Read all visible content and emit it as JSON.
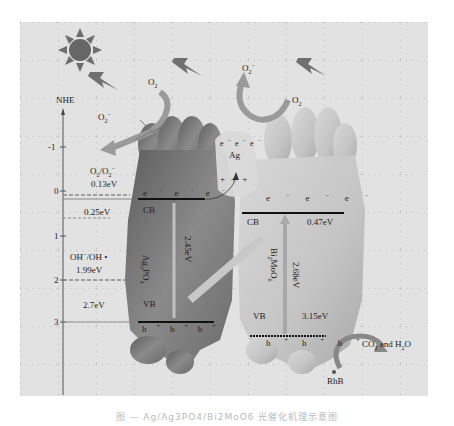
{
  "diagram": {
    "axis": {
      "label": "NHE",
      "ticks": [
        "-1",
        "0",
        "1",
        "2",
        "3"
      ]
    },
    "reference_levels": [
      {
        "label": "O2/O2-",
        "value": "0.13eV"
      },
      {
        "label": "OH-/OH•",
        "value": "1.99eV"
      }
    ],
    "ag3po4": {
      "name": "Ag3PO4",
      "cb_label": "CB",
      "vb_label": "VB",
      "cb_value": "0.25eV",
      "vb_value": "2.7eV",
      "band_gap": "2.45eV",
      "electrons": [
        "e-",
        "e-",
        "e-"
      ],
      "holes": [
        "h+",
        "h+",
        "h+"
      ]
    },
    "ag": {
      "name": "Ag",
      "electrons": [
        "e-",
        "e-",
        "e-"
      ],
      "holes": [
        "+",
        "+",
        "+"
      ]
    },
    "bi2moo6": {
      "name": "Bi2MoO6",
      "cb_label": "CB",
      "vb_label": "VB",
      "cb_value": "0.47eV",
      "vb_value": "3.15eV",
      "band_gap": "2.68eV",
      "electrons": [
        "e-",
        "e-",
        "e-"
      ],
      "holes": [
        "h+",
        "h+",
        "h+"
      ]
    },
    "reactions": {
      "left_o2": "O2",
      "left_o2_radical": "O2-",
      "right_o2": "O2",
      "right_o2_radical": "O2-",
      "pollutant": "RhB",
      "products": "CO2 and H2O"
    },
    "colors": {
      "background": "#e2e2e2",
      "ag3po4": "#7c7c7c",
      "bi2moo6": "#c6c6c6",
      "ag": "#d9d9d9",
      "arrow": "#9a9a9a",
      "sun": "#6a6a6a"
    }
  },
  "caption": "图 — Ag/Ag3PO4/Bi2MoO6 光催化机理示意图"
}
